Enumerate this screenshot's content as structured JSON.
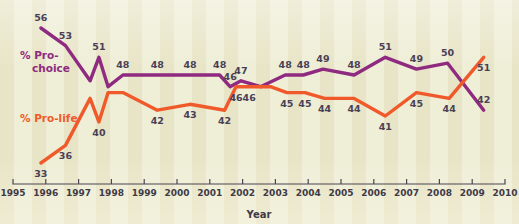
{
  "chart_data": {
    "type": "line",
    "title": "",
    "xlabel": "Year",
    "ylabel": "",
    "xlim": [
      1995,
      2010
    ],
    "ylim": [
      30,
      58
    ],
    "grid": false,
    "legend_position": "inline-left",
    "x_tick_labels": [
      "1995",
      "1996",
      "1997",
      "1998",
      "1999",
      "2000",
      "2001",
      "2002",
      "2003",
      "2004",
      "2005",
      "2006",
      "2007",
      "2008",
      "2009",
      "2010"
    ],
    "series": [
      {
        "name": "% Pro-choice",
        "color": "#8e2a80",
        "x": [
          1995.85,
          1996.6,
          1997.35,
          1997.62,
          1997.9,
          1998.35,
          1999.4,
          2000.4,
          2001.3,
          2001.62,
          2001.95,
          2002.55,
          2003.3,
          2003.85,
          2004.45,
          2005.4,
          2006.35,
          2007.3,
          2008.25,
          2009.35
        ],
        "y": [
          56,
          53,
          47,
          51,
          46,
          48,
          48,
          48,
          48,
          46,
          47,
          46,
          48,
          48,
          49,
          48,
          51,
          49,
          50,
          42
        ],
        "labels": [
          "56",
          "53",
          "",
          "51",
          "",
          "48",
          "48",
          "48",
          "48",
          "46",
          "47",
          "",
          "48",
          "48",
          "49",
          "48",
          "51",
          "49",
          "50",
          "42"
        ]
      },
      {
        "name": "% Pro-life",
        "color": "#f0592a",
        "x": [
          1995.85,
          1996.6,
          1997.35,
          1997.62,
          1997.9,
          1998.35,
          1999.4,
          2000.4,
          2001.45,
          2001.8,
          2002.2,
          2002.85,
          2003.35,
          2003.9,
          2004.5,
          2005.4,
          2006.35,
          2007.3,
          2008.3,
          2009.35
        ],
        "y": [
          33,
          36,
          44,
          40,
          45,
          45,
          42,
          43,
          42,
          46,
          46,
          46,
          45,
          45,
          44,
          44,
          41,
          45,
          44,
          51
        ],
        "labels": [
          "33",
          "36",
          "",
          "40",
          "",
          "",
          "42",
          "43",
          "42",
          "46",
          "46",
          "",
          "45",
          "45",
          "44",
          "44",
          "41",
          "45",
          "44",
          "51"
        ]
      }
    ],
    "data_labels": {
      "pro_choice": [
        "56",
        "53",
        "51",
        "48",
        "48",
        "48",
        "46",
        "47",
        "48",
        "48",
        "49",
        "48",
        "51",
        "49",
        "50",
        "42"
      ],
      "pro_life": [
        "33",
        "36",
        "40",
        "42",
        "43",
        "42",
        "46",
        "46",
        "45",
        "45",
        "44",
        "44",
        "41",
        "45",
        "44",
        "51"
      ]
    }
  },
  "legend": {
    "pro_choice_line1": "% Pro-",
    "pro_choice_line2": "choice",
    "pro_life": "% Pro-life"
  },
  "axis": {
    "x_title": "Year"
  },
  "colors": {
    "pro_choice": "#8e2a80",
    "pro_life": "#f0592a",
    "background": "#efeed7",
    "axis": "#4a4550",
    "label_text": "#4a3f55"
  }
}
